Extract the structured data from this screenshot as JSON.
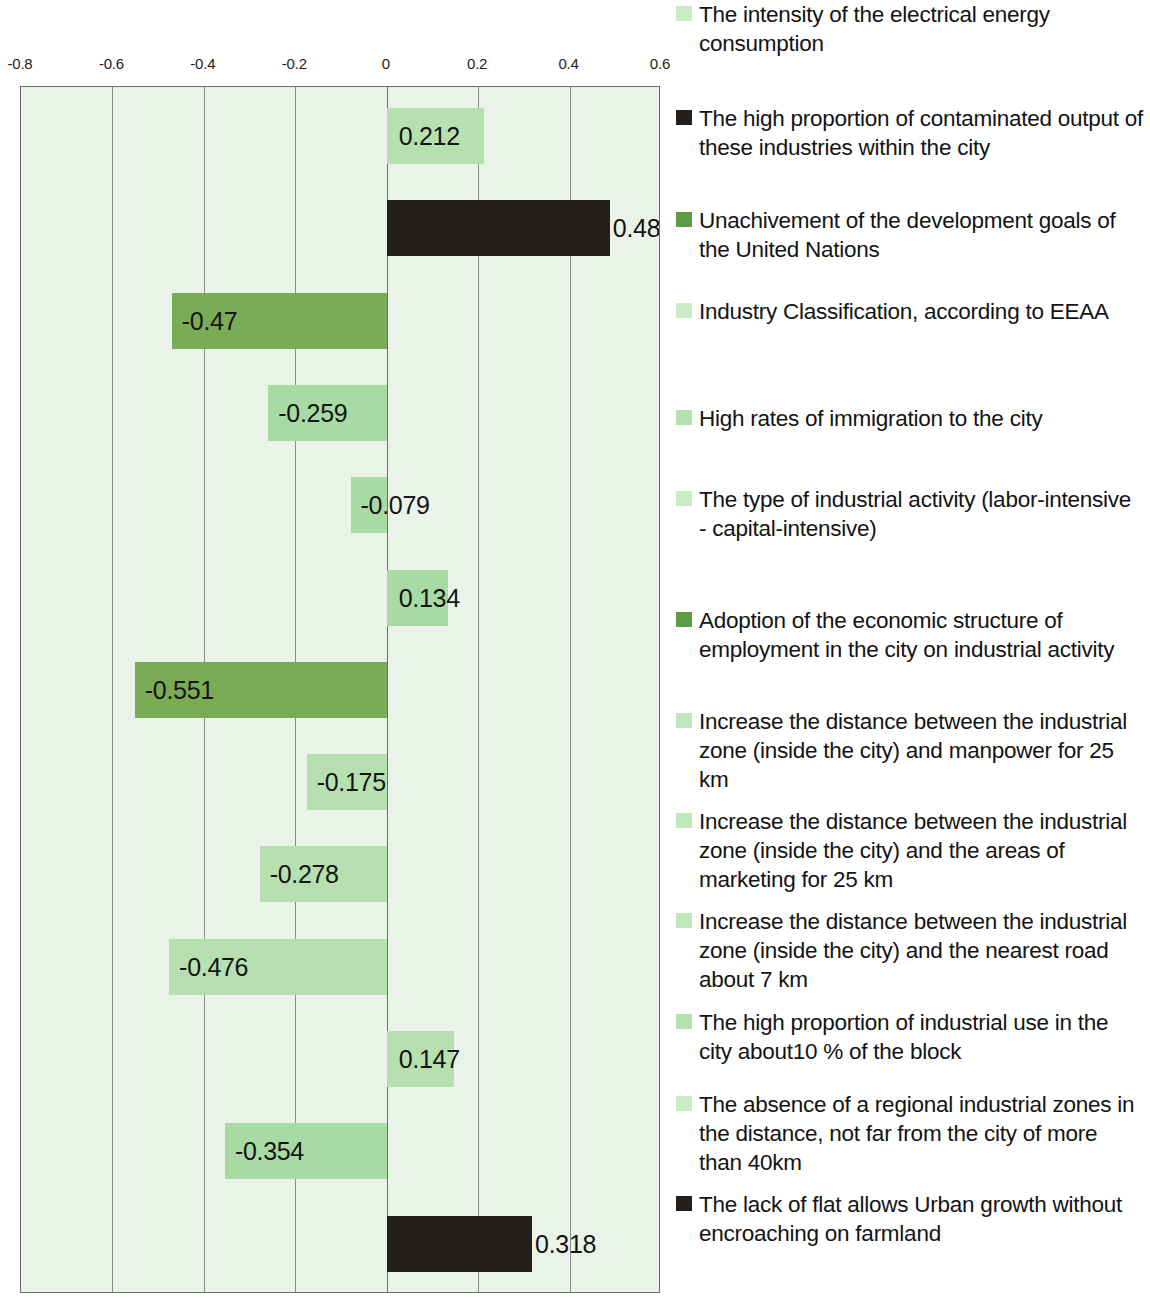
{
  "chart_data": {
    "type": "bar",
    "orientation": "horizontal",
    "title": "",
    "xlabel": "",
    "ylabel": "",
    "xlim": [
      -0.8,
      0.6
    ],
    "xticks": [
      "-0.8",
      "-0.6",
      "-0.4",
      "-0.2",
      "0",
      "0.2",
      "0.4",
      "0.6"
    ],
    "xtick_values": [
      -0.8,
      -0.6,
      -0.4,
      -0.2,
      0,
      0.2,
      0.4,
      0.6
    ],
    "grid": true,
    "legend_position": "right",
    "plot_background": "#eaf3e8",
    "categories": [
      "The intensity of the electrical energy consumption",
      "The high proportion of contaminated output of these industries within the city",
      "Unachivement of  the development goals of the United Nations",
      "Industry Classification, according to EEAA",
      "High rates of immigration to the city",
      "The type of industrial activity (labor-intensive - capital-intensive)",
      "Adoption of the economic structure of employment in the city on industrial activity",
      "Increase the distance between the industrial zone (inside the city) and manpower for 25 km",
      "Increase the distance between the industrial zone (inside the city) and the areas of marketing for 25 km",
      "Increase the distance between the industrial zone (inside the city) and the nearest road about 7 km",
      "The high proportion of industrial use in the city about10 % of the block",
      "The absence of a regional industrial zones in the distance, not far from the city of more than 40km",
      "The lack of flat allows Urban growth without encroaching on farmland"
    ],
    "values": [
      0.212,
      0.488,
      -0.47,
      -0.259,
      -0.079,
      0.134,
      -0.551,
      -0.175,
      -0.278,
      -0.476,
      0.147,
      -0.354,
      0.318
    ],
    "value_labels": [
      "0.212",
      "0.488",
      "-0.47",
      "-0.259",
      "-0.079",
      "0.134",
      "-0.551",
      "-0.175",
      "-0.278",
      "-0.476",
      "0.147",
      "-0.354",
      "0.318"
    ],
    "bar_colors": [
      "#b6e0b0",
      "#231f1c",
      "#79ac55",
      "#a8dba4",
      "#a8dba4",
      "#a8dba4",
      "#79ac55",
      "#b6e0b0",
      "#b6e0b0",
      "#b6e0b0",
      "#b6e0b0",
      "#a8dba4",
      "#231f1c"
    ]
  },
  "axis": {
    "ticks": [
      {
        "label": "-0.8",
        "value": -0.8
      },
      {
        "label": "-0.6",
        "value": -0.6
      },
      {
        "label": "-0.4",
        "value": -0.4
      },
      {
        "label": "-0.2",
        "value": -0.2
      },
      {
        "label": "0",
        "value": 0
      },
      {
        "label": "0.2",
        "value": 0.2
      },
      {
        "label": "0.4",
        "value": 0.4
      },
      {
        "label": "0.6",
        "value": 0.6
      }
    ]
  },
  "legend": {
    "items": [
      {
        "label": "The intensity of the electrical energy consumption",
        "color": "#c9ecc4",
        "top": 0
      },
      {
        "label": "The high proportion of contaminated output of these industries within the city",
        "color": "#231f1c",
        "top": 104
      },
      {
        "label": "Unachivement of  the development goals of the United Nations",
        "color": "#5f9a46",
        "top": 206
      },
      {
        "label": "Industry Classification, according to EEAA",
        "color": "#c9ecc4",
        "top": 297
      },
      {
        "label": "High rates of immigration to the city",
        "color": "#b4e2ae",
        "top": 404
      },
      {
        "label": "The type of industrial activity (labor-intensive - capital-intensive)",
        "color": "#c9ecc4",
        "top": 485
      },
      {
        "label": "Adoption of the economic structure of employment in the city on industrial activity",
        "color": "#5f9a46",
        "top": 606
      },
      {
        "label": "Increase the distance between the industrial zone (inside the city) and manpower for 25 km",
        "color": "#c2e8bd",
        "top": 707
      },
      {
        "label": "Increase the distance between the industrial zone (inside the city) and the areas of marketing for 25 km",
        "color": "#c2e8bd",
        "top": 807
      },
      {
        "label": "Increase the distance between the industrial zone (inside the city) and the nearest road about 7 km",
        "color": "#c2e8bd",
        "top": 907
      },
      {
        "label": "The high proportion of industrial use in the city about10 % of the block",
        "color": "#b4e2ae",
        "top": 1008
      },
      {
        "label": "The absence of a regional industrial zones in the distance, not far from the city of more than 40km",
        "color": "#c9ecc4",
        "top": 1090
      },
      {
        "label": "The lack of flat allows Urban growth without encroaching on farmland",
        "color": "#231f1c",
        "top": 1190
      }
    ]
  }
}
